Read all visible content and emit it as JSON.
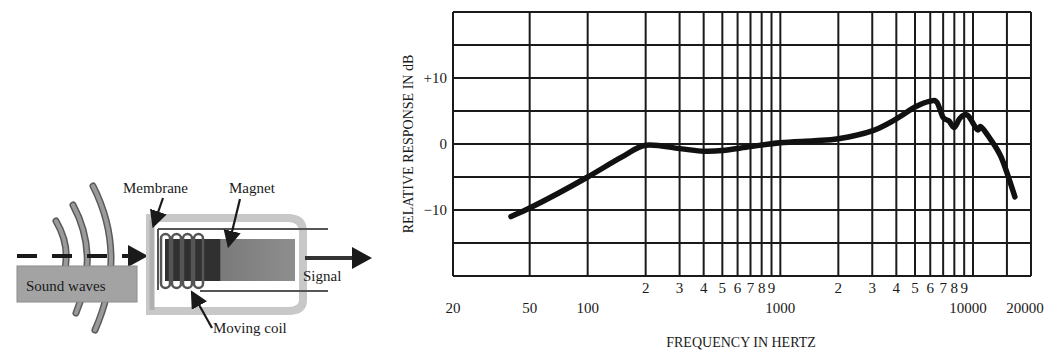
{
  "diagram": {
    "labels": {
      "sound_waves": "Sound waves",
      "membrane": "Membrane",
      "magnet": "Magnet",
      "moving_coil": "Moving coil",
      "signal": "Signal"
    },
    "colors": {
      "wave_gray": "#8c8c8c",
      "box_gray": "#a6a6a6",
      "housing_gray": "#c8c8c8",
      "magnet_dark": "#3a3a3a",
      "magnet_light": "#8a8a8a",
      "ink": "#1a1a1a"
    }
  },
  "chart_data": {
    "type": "line",
    "title": "",
    "xlabel": "FREQUENCY IN HERTZ",
    "ylabel": "RELATIVE RESPONSE IN dB",
    "xscale": "log",
    "xlim": [
      20,
      20000
    ],
    "ylim": [
      -20,
      20
    ],
    "grid": true,
    "legend": null,
    "x_tick_labels_major": [
      "20",
      "50",
      "100",
      "1000",
      "10000",
      "20000"
    ],
    "x_tick_labels_minor_row": [
      "2",
      "3",
      "4",
      "5",
      "6",
      "7",
      "8",
      "9",
      "2",
      "3",
      "4",
      "5",
      "6",
      "7",
      "8",
      "9"
    ],
    "y_tick_labels": [
      "+10",
      "0",
      "-10"
    ],
    "y_gridlines": [
      -20,
      -15,
      -10,
      -5,
      0,
      5,
      10,
      15,
      20
    ],
    "x_gridlines": [
      20,
      50,
      100,
      200,
      300,
      400,
      500,
      600,
      700,
      800,
      900,
      1000,
      2000,
      3000,
      4000,
      5000,
      6000,
      7000,
      8000,
      9000,
      10000,
      15000,
      20000
    ],
    "series": [
      {
        "name": "Frequency response",
        "x": [
          40,
          50,
          70,
          100,
          150,
          200,
          300,
          400,
          500,
          700,
          1000,
          1500,
          2000,
          3000,
          4000,
          5000,
          6000,
          6500,
          7000,
          7500,
          8000,
          8500,
          9000,
          9500,
          10500,
          11000,
          12000,
          14000,
          16500
        ],
        "y": [
          -11,
          -9.7,
          -7.5,
          -5,
          -2,
          -0.2,
          -0.7,
          -1.1,
          -1,
          -0.4,
          0.2,
          0.5,
          0.8,
          2,
          3.8,
          5.6,
          6.5,
          6.3,
          4,
          3.5,
          2.5,
          3.8,
          4.4,
          4.2,
          2.2,
          2.6,
          1.2,
          -2,
          -8
        ]
      }
    ],
    "colors": {
      "curve": "#111111",
      "grid": "#1a1a1a"
    }
  }
}
